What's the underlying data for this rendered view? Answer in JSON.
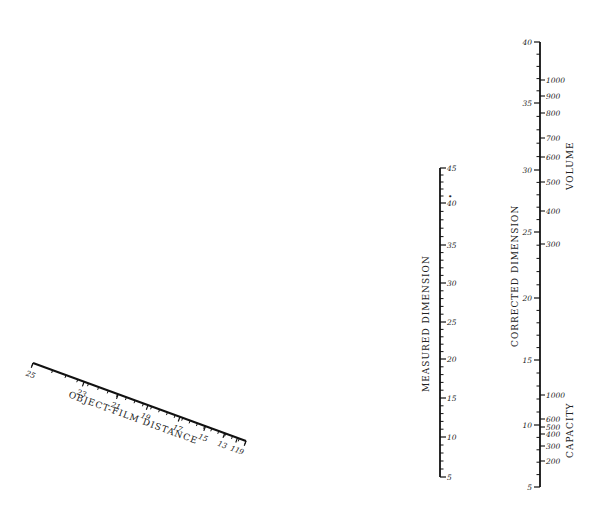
{
  "chart_data": {
    "type": "nomogram",
    "title": "",
    "scales": [
      {
        "name": "object-film-distance",
        "label": "OBJECT-FILM DISTANCE",
        "orientation": "diagonal",
        "start": [
          33,
          363
        ],
        "end": [
          246,
          441
        ],
        "ticks": [
          {
            "label": "25",
            "t": 0.0
          },
          {
            "label": "23",
            "t": 0.24
          },
          {
            "label": "21",
            "t": 0.4
          },
          {
            "label": "19",
            "t": 0.54
          },
          {
            "label": "17",
            "t": 0.69
          },
          {
            "label": "15",
            "t": 0.81
          },
          {
            "label": "13",
            "t": 0.9
          },
          {
            "label": "11",
            "t": 0.96
          },
          {
            "label": "9",
            "t": 1.0
          }
        ],
        "minor_ticks": 24
      },
      {
        "name": "measured-dimension",
        "label": "MEASURED DIMENSION",
        "orientation": "vertical",
        "x": 440,
        "y_top": 168,
        "y_bottom": 477,
        "ticks": [
          {
            "label": "45",
            "y": 168
          },
          {
            "label": "40",
            "y": 203
          },
          {
            "label": "35",
            "y": 245
          },
          {
            "label": "30",
            "y": 283
          },
          {
            "label": "25",
            "y": 322
          },
          {
            "label": "20",
            "y": 359
          },
          {
            "label": "15",
            "y": 398
          },
          {
            "label": "10",
            "y": 437
          },
          {
            "label": "5",
            "y": 477
          }
        ],
        "minor_per_major": 5,
        "marker": {
          "label": "•",
          "y": 196
        }
      },
      {
        "name": "corrected-dimension",
        "label": "CORRECTED DIMENSION",
        "orientation": "vertical",
        "x": 540,
        "y_top": 42,
        "y_bottom": 487,
        "ticks": [
          {
            "label": "40",
            "y": 42
          },
          {
            "label": "35",
            "y": 103
          },
          {
            "label": "30",
            "y": 170
          },
          {
            "label": "25",
            "y": 232
          },
          {
            "label": "20",
            "y": 298
          },
          {
            "label": "15",
            "y": 360
          },
          {
            "label": "10",
            "y": 425
          },
          {
            "label": "5",
            "y": 487
          }
        ],
        "minor_per_major": 5
      },
      {
        "name": "volume",
        "label": "VOLUME",
        "orientation": "vertical",
        "side": "right",
        "ticks": [
          {
            "label": "1000",
            "y": 80
          },
          {
            "label": "900",
            "y": 96
          },
          {
            "label": "800",
            "y": 113
          },
          {
            "label": "700",
            "y": 138
          },
          {
            "label": "600",
            "y": 157
          },
          {
            "label": "500",
            "y": 182
          },
          {
            "label": "400",
            "y": 211
          },
          {
            "label": "300",
            "y": 244
          }
        ]
      },
      {
        "name": "capacity",
        "label": "CAPACITY",
        "orientation": "vertical",
        "side": "right",
        "ticks": [
          {
            "label": "1000",
            "y": 395
          },
          {
            "label": "600",
            "y": 419
          },
          {
            "label": "500",
            "y": 427
          },
          {
            "label": "400",
            "y": 434
          },
          {
            "label": "300",
            "y": 446
          },
          {
            "label": "200",
            "y": 461
          }
        ]
      }
    ]
  }
}
